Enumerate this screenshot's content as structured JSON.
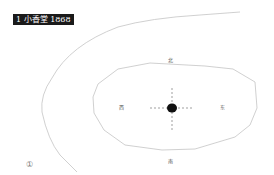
{
  "title": "1 小香堂 1868",
  "figure_number": "①",
  "directions": {
    "north": "北",
    "south": "南",
    "west": "西",
    "east": "东"
  },
  "colors": {
    "line": "#bdbdbd",
    "center_dot": "#111111",
    "badge_bg": "#1a1a1a"
  }
}
